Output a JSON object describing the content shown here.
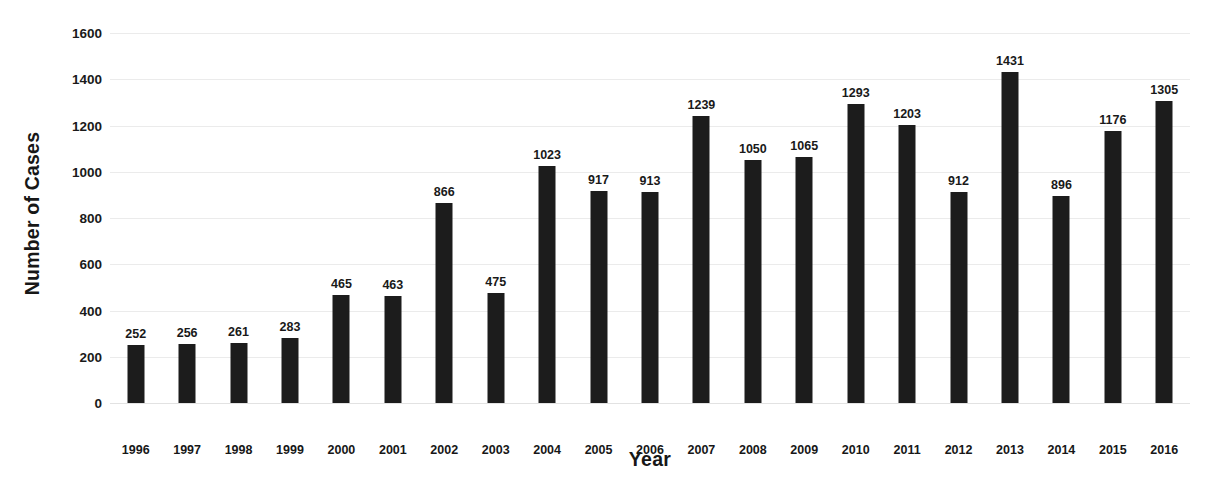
{
  "chart_data": {
    "type": "bar",
    "title": "",
    "xlabel": "Year",
    "ylabel": "Number of Cases",
    "categories": [
      "1996",
      "1997",
      "1998",
      "1999",
      "2000",
      "2001",
      "2002",
      "2003",
      "2004",
      "2005",
      "2006",
      "2007",
      "2008",
      "2009",
      "2010",
      "2011",
      "2012",
      "2013",
      "2014",
      "2015",
      "2016"
    ],
    "values": [
      252,
      256,
      261,
      283,
      465,
      463,
      866,
      475,
      1023,
      917,
      913,
      1239,
      1050,
      1065,
      1293,
      1203,
      912,
      1431,
      896,
      1176,
      1305
    ],
    "ylim": [
      0,
      1600
    ],
    "yticks": [
      0,
      200,
      400,
      600,
      800,
      1000,
      1200,
      1400,
      1600
    ],
    "ytick_labels": [
      "0",
      "200",
      "400",
      "600",
      "800",
      "1000",
      "1200",
      "1400",
      "1600"
    ],
    "grid": true,
    "legend": false,
    "bar_color": "#1c1c1c",
    "gridline_color": "#ebebeb",
    "data_labels": [
      "252",
      "256",
      "261",
      "283",
      "465",
      "463",
      "866",
      "475",
      "1023",
      "917",
      "913",
      "1239",
      "1050",
      "1065",
      "1293",
      "1203",
      "912",
      "1431",
      "896",
      "1176",
      "1305"
    ]
  }
}
